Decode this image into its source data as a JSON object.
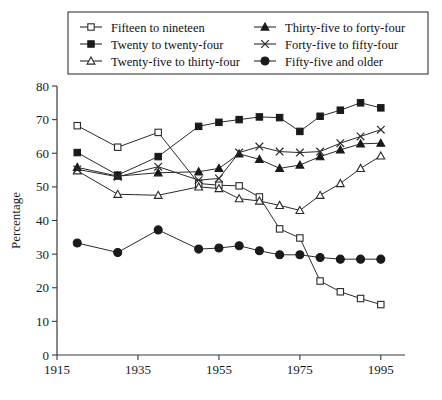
{
  "chart_data": {
    "type": "line",
    "title": "",
    "xlabel": "",
    "ylabel": "Percentage",
    "xlim": [
      1915,
      1999
    ],
    "ylim": [
      0,
      80
    ],
    "xticks": [
      1915,
      1935,
      1955,
      1975,
      1995
    ],
    "yticks": [
      0,
      10,
      20,
      30,
      40,
      50,
      60,
      70,
      80
    ],
    "grid": false,
    "legend_position": "top",
    "series": [
      {
        "name": "Fifteen to nineteen",
        "marker": "open-square",
        "x": [
          1920,
          1930,
          1940,
          1950,
          1955,
          1960,
          1965,
          1970,
          1975,
          1980,
          1985,
          1990,
          1995
        ],
        "values": [
          68.2,
          61.8,
          66.2,
          51.0,
          50.5,
          50.3,
          47.0,
          37.5,
          34.8,
          22.0,
          18.8,
          16.8,
          15.0
        ]
      },
      {
        "name": "Twenty to twenty-four",
        "marker": "filled-square",
        "x": [
          1920,
          1930,
          1940,
          1950,
          1955,
          1960,
          1965,
          1970,
          1975,
          1980,
          1985,
          1990,
          1995
        ],
        "values": [
          60.2,
          53.5,
          59.0,
          68.0,
          69.2,
          70.0,
          70.8,
          70.6,
          66.5,
          71.0,
          72.8,
          75.0,
          73.5
        ]
      },
      {
        "name": "Twenty-five to thirty-four",
        "marker": "open-triangle",
        "x": [
          1920,
          1930,
          1940,
          1950,
          1955,
          1960,
          1965,
          1970,
          1975,
          1980,
          1985,
          1990,
          1995
        ],
        "values": [
          54.8,
          47.8,
          47.5,
          50.0,
          49.5,
          46.5,
          45.8,
          44.5,
          43.0,
          47.5,
          51.0,
          55.5,
          59.2
        ]
      },
      {
        "name": "Thirty-five to forty-four",
        "marker": "filled-triangle",
        "x": [
          1920,
          1930,
          1940,
          1950,
          1955,
          1960,
          1965,
          1970,
          1975,
          1980,
          1985,
          1990,
          1995
        ],
        "values": [
          55.8,
          53.2,
          54.2,
          54.5,
          55.5,
          59.8,
          58.2,
          55.5,
          56.5,
          59.0,
          61.0,
          62.8,
          63.0
        ]
      },
      {
        "name": "Forty-five to fifty-four",
        "marker": "x-cross",
        "x": [
          1920,
          1930,
          1940,
          1950,
          1955,
          1960,
          1965,
          1970,
          1975,
          1980,
          1985,
          1990,
          1995
        ],
        "values": [
          55.2,
          53.0,
          56.0,
          52.0,
          52.5,
          60.2,
          62.0,
          60.5,
          60.2,
          60.5,
          63.0,
          65.0,
          67.0
        ]
      },
      {
        "name": "Fifty-five and older",
        "marker": "filled-circle",
        "x": [
          1920,
          1930,
          1940,
          1950,
          1955,
          1960,
          1965,
          1970,
          1975,
          1980,
          1985,
          1990,
          1995
        ],
        "values": [
          33.3,
          30.5,
          37.2,
          31.5,
          31.8,
          32.5,
          31.0,
          29.8,
          29.8,
          29.0,
          28.5,
          28.5,
          28.5
        ]
      }
    ]
  },
  "legend": {
    "entries": [
      {
        "label": "Fifteen to nineteen",
        "marker": "open-square"
      },
      {
        "label": "Thirty-five to forty-four",
        "marker": "filled-triangle"
      },
      {
        "label": "Twenty to twenty-four",
        "marker": "filled-square"
      },
      {
        "label": "Forty-five to fifty-four",
        "marker": "x-cross"
      },
      {
        "label": "Twenty-five to thirty-four",
        "marker": "open-triangle"
      },
      {
        "label": "Fifty-five and older",
        "marker": "filled-circle"
      }
    ]
  }
}
